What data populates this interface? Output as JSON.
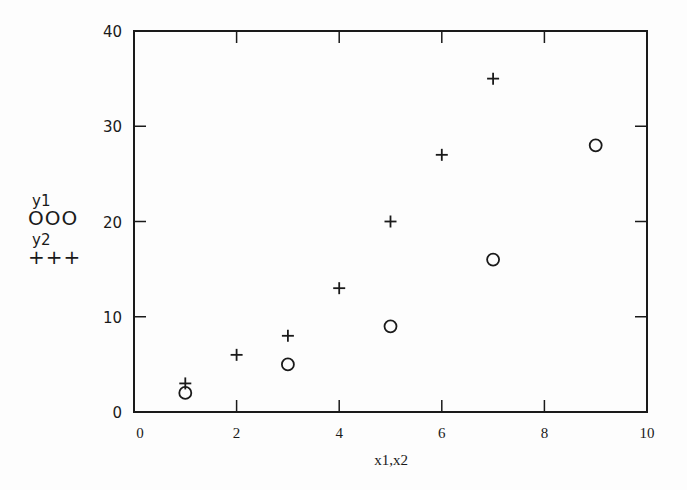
{
  "chart_data": {
    "type": "scatter",
    "title": "",
    "xlabel": "x1,x2",
    "ylabel": "",
    "xlim": [
      0,
      10
    ],
    "ylim": [
      0,
      40
    ],
    "x_ticks": [
      0,
      2,
      4,
      6,
      8,
      10
    ],
    "y_ticks": [
      0,
      10,
      20,
      30,
      40
    ],
    "grid": false,
    "legend_position": "left",
    "series": [
      {
        "name": "y1",
        "marker": "circle",
        "legend_symbol": "OOO",
        "x": [
          1,
          3,
          5,
          7,
          9
        ],
        "y": [
          2,
          5,
          9,
          16,
          28
        ]
      },
      {
        "name": "y2",
        "marker": "plus",
        "legend_symbol": "+++",
        "x": [
          1,
          2,
          3,
          4,
          5,
          6,
          7
        ],
        "y": [
          3,
          6,
          8,
          13,
          20,
          27,
          35
        ]
      }
    ]
  },
  "legend": {
    "y1_label": "y1",
    "y1_symbol": "OOO",
    "y2_label": "y2",
    "y2_symbol": "+++"
  },
  "axes": {
    "xlabel": "x1,x2"
  },
  "colors": {
    "ink": "#1a1a1a",
    "background": "#fdfdfd"
  }
}
